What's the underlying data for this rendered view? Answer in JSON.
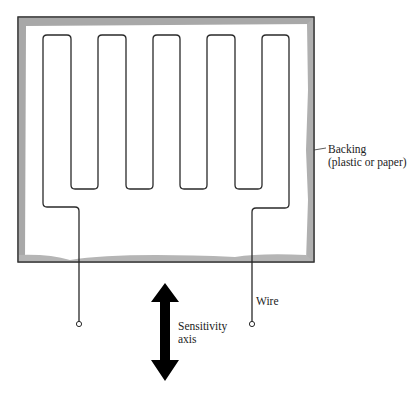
{
  "figure": {
    "type": "strain-gauge-diagram",
    "labels": {
      "backing_line1": "Backing",
      "backing_line2": "(plastic or paper)",
      "wire": "Wire",
      "sensitivity_line1": "Sensitivity",
      "sensitivity_line2": "axis"
    },
    "colors": {
      "backing_border": "#3a3a3a",
      "backing_shadow": "#a8a8a8",
      "wire": "#2a2a2a",
      "arrow": "#000000"
    }
  }
}
